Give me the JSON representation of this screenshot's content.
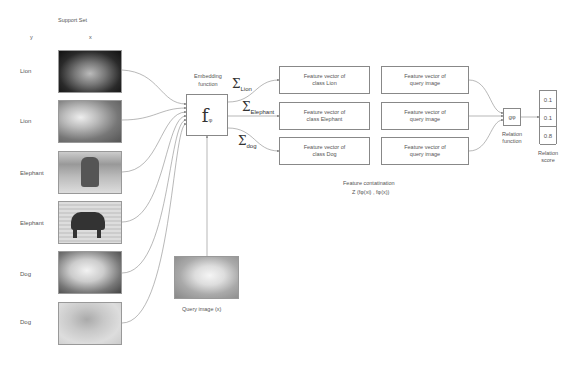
{
  "support_set": {
    "title": "Support Set",
    "col_y": "y",
    "col_x": "x",
    "items": [
      {
        "label": "Lion",
        "image": "lion-face-dark-bg"
      },
      {
        "label": "Lion",
        "image": "lion-lying"
      },
      {
        "label": "Elephant",
        "image": "elephant-front"
      },
      {
        "label": "Elephant",
        "image": "elephant-side"
      },
      {
        "label": "Dog",
        "image": "labrador"
      },
      {
        "label": "Dog",
        "image": "puppy-on-ledge"
      }
    ]
  },
  "embedding": {
    "title_line1": "Embedding",
    "title_line2": "function",
    "symbol": "f",
    "subscript": "φ"
  },
  "sums": [
    {
      "symbol": "Σ",
      "sub": "Lion"
    },
    {
      "symbol": "Σ",
      "sub": "Elephant"
    },
    {
      "symbol": "Σ",
      "sub": "dog"
    }
  ],
  "class_vectors": [
    {
      "line1": "Feature vector of",
      "line2": "class Lion"
    },
    {
      "line1": "Feature vector of",
      "line2": "class Elephant"
    },
    {
      "line1": "Feature vector of",
      "line2": "class Dog"
    }
  ],
  "query_vectors": [
    {
      "line1": "Feature vector of",
      "line2": "query image"
    },
    {
      "line1": "Feature vector of",
      "line2": "query image"
    },
    {
      "line1": "Feature vector of",
      "line2": "query image"
    }
  ],
  "concatenation": {
    "line1": "Feature contatination",
    "line2": "Z (fφ(xi) , fφ(x))"
  },
  "relation": {
    "symbol": "gφ",
    "label_line1": "Relation",
    "label_line2": "function"
  },
  "scores": {
    "values": [
      "0.1",
      "0.1",
      "0.8"
    ],
    "label_line1": "Relation",
    "label_line2": "score"
  },
  "query": {
    "label": "Query image (x)",
    "image": "golden-retriever-puppy"
  }
}
